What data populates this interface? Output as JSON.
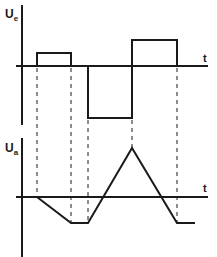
{
  "top_plot": {
    "y_label": "U",
    "y_label_sub": "e",
    "x_label": "t",
    "signal": "rectangular pulses: positive small pulse, negative larger pulse, positive pulse"
  },
  "bottom_plot": {
    "y_label": "U",
    "y_label_sub": "a",
    "x_label": "t",
    "signal": "integrator output: ramps down, flat, ramps up to peak, ramps down, flat"
  },
  "colors": {
    "line": "#1a1a1a",
    "background": "#ffffff"
  }
}
